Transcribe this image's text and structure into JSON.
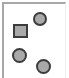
{
  "diagram": {
    "frame": {
      "color": "#a8a8a8"
    },
    "shapes": [
      {
        "type": "circle",
        "name": "circle-top-right",
        "cx": 40,
        "cy": 19,
        "r": 6.5,
        "fill": "#a9a9a9",
        "stroke": "#3c3c3c"
      },
      {
        "type": "square",
        "name": "square-left",
        "x": 13,
        "y": 24,
        "size": 14,
        "fill": "#a9a9a9",
        "stroke": "#3c3c3c"
      },
      {
        "type": "circle",
        "name": "circle-bottom-left",
        "cx": 19,
        "cy": 55,
        "r": 7,
        "fill": "#a9a9a9",
        "stroke": "#3c3c3c"
      },
      {
        "type": "circle",
        "name": "circle-bottom-right",
        "cx": 43,
        "cy": 66,
        "r": 7,
        "fill": "#a9a9a9",
        "stroke": "#3c3c3c"
      }
    ]
  }
}
